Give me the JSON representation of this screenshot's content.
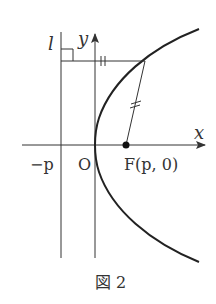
{
  "figure": {
    "caption": "図 2",
    "labels": {
      "directrix": "l",
      "y_axis": "y",
      "x_axis": "x",
      "neg_p": "−p",
      "origin": "O",
      "focus": "F(p,  0)"
    },
    "marks": {
      "equal_tick": "||"
    },
    "colors": {
      "line": "#333333",
      "curve": "#222222",
      "text": "#333333"
    }
  }
}
